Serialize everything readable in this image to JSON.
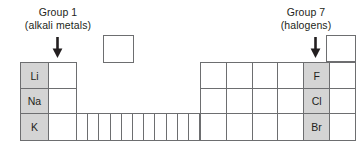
{
  "canvas": {
    "width": 357,
    "height": 143,
    "background": "#ffffff"
  },
  "style": {
    "line_color": "#6d6e70",
    "shade_color": "#d4d4d4",
    "text_color": "#231f20"
  },
  "labels": {
    "group1": {
      "line1": "Group 1",
      "line2": "(alkali metals)"
    },
    "group7": {
      "line1": "Group 7",
      "line2": "(halogens)"
    }
  },
  "arrows": [
    {
      "name": "group1-arrow",
      "points_to": "Li",
      "direction": "down"
    },
    {
      "name": "group7-arrow",
      "points_to": "F",
      "direction": "down"
    }
  ],
  "lone_boxes": [
    {
      "name": "box-hydrogen",
      "label": "",
      "shaded": false
    },
    {
      "name": "box-helium",
      "label": "",
      "shaded": false
    }
  ],
  "grid": {
    "left_block": {
      "columns": 2,
      "rows": [
        [
          {
            "label": "Li",
            "shaded": true
          },
          {
            "label": "",
            "shaded": false
          }
        ],
        [
          {
            "label": "Na",
            "shaded": true
          },
          {
            "label": "",
            "shaded": false
          }
        ],
        [
          {
            "label": "K",
            "shaded": true
          },
          {
            "label": "",
            "shaded": false
          }
        ]
      ]
    },
    "middle_block": {
      "columns": 11,
      "rows": [
        [
          {
            "label": "",
            "shaded": false
          },
          {
            "label": "",
            "shaded": false
          },
          {
            "label": "",
            "shaded": false
          },
          {
            "label": "",
            "shaded": false
          },
          {
            "label": "",
            "shaded": false
          },
          {
            "label": "",
            "shaded": false
          },
          {
            "label": "",
            "shaded": false
          },
          {
            "label": "",
            "shaded": false
          },
          {
            "label": "",
            "shaded": false
          },
          {
            "label": "",
            "shaded": false
          },
          {
            "label": "",
            "shaded": false
          }
        ]
      ]
    },
    "right_block": {
      "columns": 6,
      "rows": [
        [
          {
            "label": "",
            "shaded": false
          },
          {
            "label": "",
            "shaded": false
          },
          {
            "label": "",
            "shaded": false
          },
          {
            "label": "",
            "shaded": false
          },
          {
            "label": "F",
            "shaded": true
          },
          {
            "label": "",
            "shaded": false
          }
        ],
        [
          {
            "label": "",
            "shaded": false
          },
          {
            "label": "",
            "shaded": false
          },
          {
            "label": "",
            "shaded": false
          },
          {
            "label": "",
            "shaded": false
          },
          {
            "label": "Cl",
            "shaded": true
          },
          {
            "label": "",
            "shaded": false
          }
        ],
        [
          {
            "label": "",
            "shaded": false
          },
          {
            "label": "",
            "shaded": false
          },
          {
            "label": "",
            "shaded": false
          },
          {
            "label": "",
            "shaded": false
          },
          {
            "label": "Br",
            "shaded": true
          },
          {
            "label": "",
            "shaded": false
          }
        ]
      ]
    }
  }
}
